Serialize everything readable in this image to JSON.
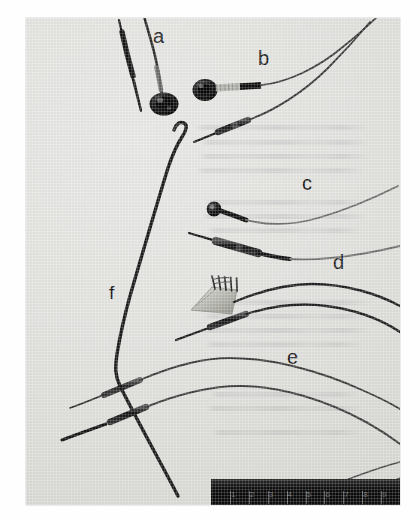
{
  "figure": {
    "kind": "photograph",
    "background_color": "#e3e3e0",
    "ink_color": "#1a1a1a",
    "plate": {
      "x": 26,
      "y": 18,
      "width": 374,
      "height": 487
    }
  },
  "panel_labels": [
    {
      "id": "a",
      "text": "a",
      "x": 153,
      "y": 26,
      "description": "disc cup electrode with short lead and needle probe"
    },
    {
      "id": "b",
      "text": "b",
      "x": 258,
      "y": 48,
      "description": "disc electrode with shielded lead plus subdermal needle electrode"
    },
    {
      "id": "c",
      "text": "c",
      "x": 302,
      "y": 173,
      "description": "small ball-tip electrode and insulated pin connector lead"
    },
    {
      "id": "d",
      "text": "d",
      "x": 333,
      "y": 252,
      "description": "multi-pin comb connector with twin leads"
    },
    {
      "id": "e",
      "text": "e",
      "x": 287,
      "y": 347,
      "description": "pair of fine needle electrodes with moulded hubs"
    },
    {
      "id": "f",
      "text": "f",
      "x": 109,
      "y": 283,
      "description": "long bent stiff wire depth electrode spanning the left of the frame"
    }
  ],
  "scale_ruler": {
    "label": "ruler scale bar",
    "x": 185,
    "y": 461,
    "width": 189,
    "height": 42,
    "color": "#101010",
    "unit": "cm",
    "tick_numbers": [
      "1",
      "2",
      "3",
      "4",
      "5",
      "6",
      "7",
      "8",
      "9"
    ],
    "tick_count": 9
  },
  "bleed_through_lines": [
    {
      "x": 195,
      "y": 125,
      "width": 175
    },
    {
      "x": 200,
      "y": 140,
      "width": 170
    },
    {
      "x": 198,
      "y": 154,
      "width": 172
    },
    {
      "x": 196,
      "y": 168,
      "width": 168
    },
    {
      "x": 205,
      "y": 200,
      "width": 160
    },
    {
      "x": 202,
      "y": 214,
      "width": 165
    },
    {
      "x": 207,
      "y": 228,
      "width": 155
    },
    {
      "x": 200,
      "y": 300,
      "width": 170
    },
    {
      "x": 203,
      "y": 314,
      "width": 166
    },
    {
      "x": 199,
      "y": 328,
      "width": 172
    },
    {
      "x": 205,
      "y": 342,
      "width": 158
    },
    {
      "x": 210,
      "y": 392,
      "width": 150
    },
    {
      "x": 206,
      "y": 406,
      "width": 156
    },
    {
      "x": 212,
      "y": 430,
      "width": 148
    }
  ]
}
